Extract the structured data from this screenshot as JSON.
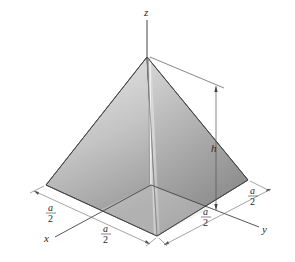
{
  "figure": {
    "type": "square pyramid with coordinate axes",
    "axes": {
      "z_label": "z",
      "x_label": "x",
      "y_label": "y"
    },
    "dimensions": {
      "height_label": "h",
      "half_side_numerator": "a",
      "half_side_denominator": "2",
      "left_segments": [
        {
          "numerator": "a",
          "denominator": "2"
        },
        {
          "numerator": "a",
          "denominator": "2"
        }
      ],
      "right_segments": [
        {
          "numerator": "a",
          "denominator": "2"
        },
        {
          "numerator": "a",
          "denominator": "2"
        }
      ]
    },
    "colors": {
      "line": "#3a3a3a",
      "dim_line": "#555555",
      "face_left_light": "#e6e6e6",
      "face_left_dark": "#9a9a9a",
      "face_right_light": "#d0d0d0",
      "face_right_dark": "#8c8c8c"
    }
  }
}
